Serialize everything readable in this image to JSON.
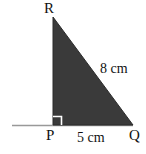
{
  "figure": {
    "kind": "right-triangle-diagram",
    "canvas": {
      "width": 146,
      "height": 154
    },
    "background_color": "#ffffff",
    "fill_color": "#3a3a3a",
    "stroke_color": "#2b2b2b",
    "baseline_color": "#999999",
    "text_color": "#111111"
  },
  "vertices": {
    "R": {
      "label": "R",
      "x": 53,
      "y": 17
    },
    "P": {
      "label": "P",
      "x": 53,
      "y": 125
    },
    "Q": {
      "label": "Q",
      "x": 133,
      "y": 125
    }
  },
  "sides": {
    "hypotenuse": {
      "label": "8 cm",
      "value": 8,
      "unit": "cm",
      "from": "R",
      "to": "Q"
    },
    "base": {
      "label": "5 cm",
      "value": 5,
      "unit": "cm",
      "from": "P",
      "to": "Q"
    },
    "vertical": {
      "label": "",
      "from": "R",
      "to": "P"
    }
  },
  "markers": {
    "right_angle": {
      "at": "P",
      "size": 9,
      "color": "#ffffff"
    }
  },
  "baseline": {
    "x1": 12,
    "x2": 133,
    "y": 125
  }
}
